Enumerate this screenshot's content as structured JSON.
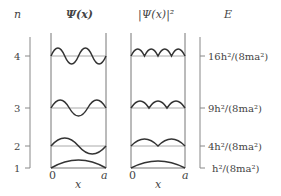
{
  "diagram": {
    "headers": {
      "n": "n",
      "psi": "Ψ(x)",
      "psi_sq": "|Ψ(x)|²",
      "energy": "E"
    },
    "x_axis": {
      "psi": {
        "start": "0",
        "end": "a",
        "label": "x"
      },
      "psi_sq": {
        "start": "0",
        "end": "a",
        "label": "x"
      }
    },
    "levels": [
      {
        "n": "4",
        "energy_label": "16h²/(8ma²)"
      },
      {
        "n": "3",
        "energy_label": "9h²/(8ma²)"
      },
      {
        "n": "2",
        "energy_label": "4h²/(8ma²)"
      },
      {
        "n": "1",
        "energy_label": "h²/(8ma²)"
      }
    ],
    "colors": {
      "axis": "#888888",
      "curve": "#333333",
      "baseline": "#999999",
      "text": "#444444"
    }
  }
}
